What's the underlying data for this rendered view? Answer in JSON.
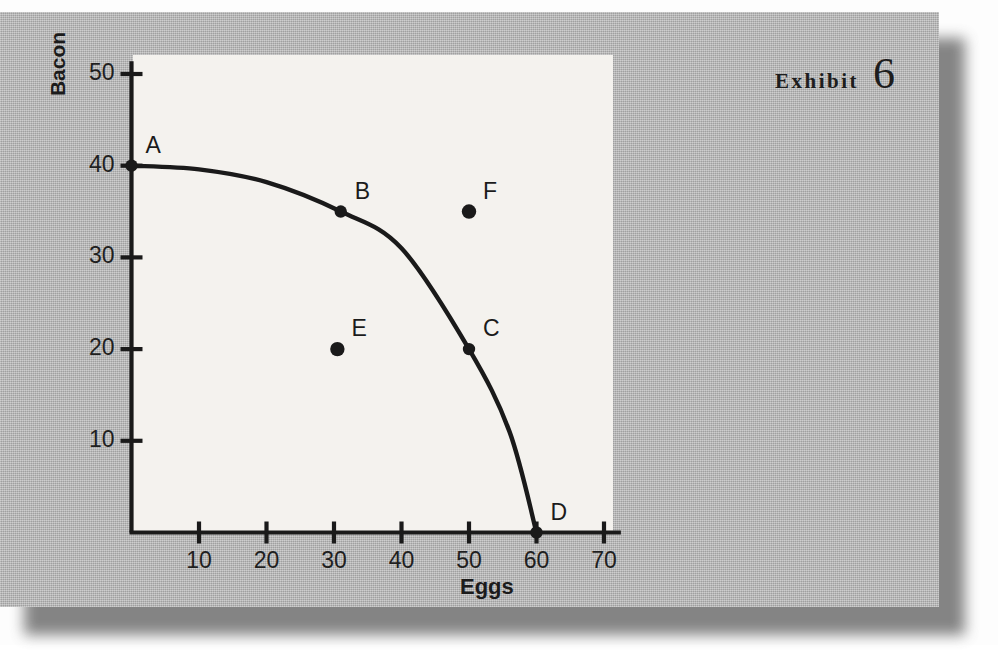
{
  "exhibit": {
    "word": "Exhibit",
    "number": "6"
  },
  "chart_data": {
    "type": "line",
    "title": "",
    "xlabel": "Eggs",
    "ylabel": "Bacon",
    "xlim": [
      0,
      72
    ],
    "ylim": [
      0,
      52
    ],
    "grid": false,
    "legend": "none",
    "xticks": [
      "10",
      "20",
      "30",
      "40",
      "50",
      "60",
      "70"
    ],
    "xtick_values": [
      10,
      20,
      30,
      40,
      50,
      60,
      70
    ],
    "yticks": [
      "10",
      "20",
      "30",
      "40",
      "50"
    ],
    "ytick_values": [
      10,
      20,
      30,
      40,
      50
    ],
    "series": [
      {
        "name": "Production possibilities frontier",
        "x": [
          0,
          10,
          20,
          31,
          40,
          50,
          56,
          60
        ],
        "y": [
          40,
          39.6,
          38.2,
          35,
          31,
          20,
          11,
          0
        ]
      }
    ],
    "annotations": [
      {
        "label": "A",
        "x": 0,
        "y": 40,
        "on_curve": true,
        "label_dx": 14,
        "label_dy": -34
      },
      {
        "label": "B",
        "x": 31,
        "y": 35,
        "on_curve": true,
        "label_dx": 14,
        "label_dy": -34
      },
      {
        "label": "C",
        "x": 50,
        "y": 20,
        "on_curve": true,
        "label_dx": 14,
        "label_dy": -34
      },
      {
        "label": "D",
        "x": 60,
        "y": 0,
        "on_curve": true,
        "label_dx": 14,
        "label_dy": -34
      },
      {
        "label": "E",
        "x": 30.5,
        "y": 20,
        "on_curve": false,
        "label_dx": 14,
        "label_dy": -34
      },
      {
        "label": "F",
        "x": 50,
        "y": 35,
        "on_curve": false,
        "label_dx": 14,
        "label_dy": -34
      }
    ],
    "colors": {
      "curve": "#1a1a1a",
      "point": "#1a1a1a",
      "axis": "#1a1a1a",
      "plot_background": "#f4f2ee",
      "card_background": "#b2b2b2"
    }
  }
}
